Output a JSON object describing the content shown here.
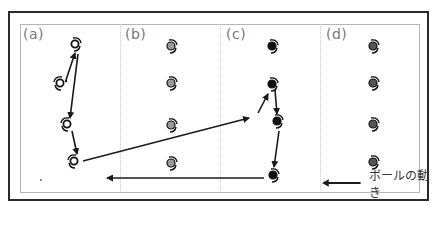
{
  "panels": [
    {
      "id": "a",
      "label": "(a)"
    },
    {
      "id": "b",
      "label": "(b)"
    },
    {
      "id": "c",
      "label": "(c)"
    },
    {
      "id": "d",
      "label": "(d)"
    }
  ],
  "legend": {
    "icon": "left-arrow-icon",
    "label": "ボールの動き"
  },
  "colors": {
    "frame": "#2a2a2a",
    "inner_frame": "#b5b5b5",
    "divider": "#c8c8c8",
    "arrow": "#1a1a1a",
    "player_open": "#ffffff",
    "player_gray": "#9a9a9a",
    "player_black": "#111111",
    "player_dark_gray": "#555555"
  },
  "players": {
    "a": [
      {
        "x": 75,
        "y": 44,
        "style": "open",
        "facing": "right"
      },
      {
        "x": 60,
        "y": 83,
        "style": "open",
        "facing": "left"
      },
      {
        "x": 67,
        "y": 124,
        "style": "open",
        "facing": "left"
      },
      {
        "x": 74,
        "y": 161,
        "style": "open",
        "facing": "left"
      }
    ],
    "b": [
      {
        "x": 171,
        "y": 46,
        "style": "gray",
        "facing": "right"
      },
      {
        "x": 171,
        "y": 83,
        "style": "gray",
        "facing": "right"
      },
      {
        "x": 171,
        "y": 125,
        "style": "gray",
        "facing": "right"
      },
      {
        "x": 171,
        "y": 163,
        "style": "gray",
        "facing": "right"
      }
    ],
    "c": [
      {
        "x": 272,
        "y": 46,
        "style": "black",
        "facing": "right"
      },
      {
        "x": 272,
        "y": 84,
        "style": "black",
        "facing": "right"
      },
      {
        "x": 277,
        "y": 121,
        "style": "black",
        "facing": "right"
      },
      {
        "x": 273,
        "y": 175,
        "style": "black",
        "facing": "right"
      }
    ],
    "d": [
      {
        "x": 373,
        "y": 46,
        "style": "darkgray",
        "facing": "right"
      },
      {
        "x": 373,
        "y": 83,
        "style": "darkgray",
        "facing": "right"
      },
      {
        "x": 373,
        "y": 124,
        "style": "darkgray",
        "facing": "right"
      },
      {
        "x": 373,
        "y": 162,
        "style": "darkgray",
        "facing": "right"
      }
    ]
  },
  "ball_moves": [
    {
      "from": [
        66,
        80
      ],
      "to": [
        75,
        53
      ]
    },
    {
      "from": [
        78,
        54
      ],
      "to": [
        70,
        118
      ]
    },
    {
      "from": [
        72,
        131
      ],
      "to": [
        77,
        154
      ]
    },
    {
      "from": [
        83,
        161
      ],
      "to": [
        249,
        118
      ]
    },
    {
      "from": [
        258,
        113
      ],
      "to": [
        268,
        94
      ]
    },
    {
      "from": [
        275,
        90
      ],
      "to": [
        277,
        114
      ]
    },
    {
      "from": [
        279,
        131
      ],
      "to": [
        274,
        167
      ]
    },
    {
      "from": [
        264,
        178
      ],
      "to": [
        107,
        178
      ]
    }
  ]
}
